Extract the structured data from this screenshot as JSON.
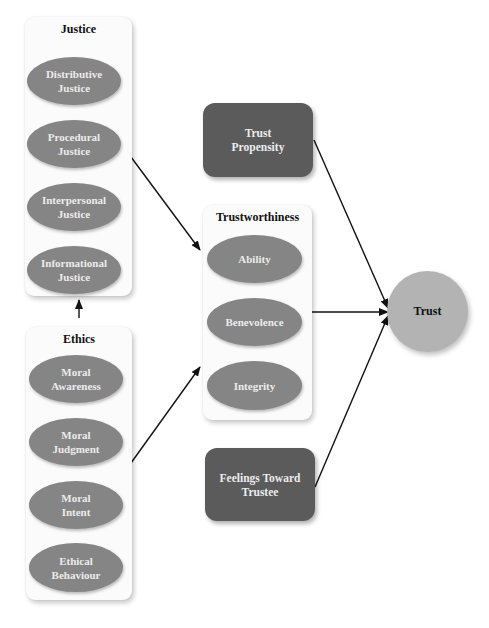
{
  "justice": {
    "title": "Justice",
    "items": [
      {
        "label": "Distributive\nJustice"
      },
      {
        "label": "Procedural\nJustice"
      },
      {
        "label": "Interpersonal\nJustice"
      },
      {
        "label": "Informational\nJustice"
      }
    ]
  },
  "ethics": {
    "title": "Ethics",
    "items": [
      {
        "label": "Moral\nAwareness"
      },
      {
        "label": "Moral\nJudgment"
      },
      {
        "label": "Moral\nIntent"
      },
      {
        "label": "Ethical\nBehaviour"
      }
    ]
  },
  "trustworthiness": {
    "title": "Trustworthiness",
    "items": [
      {
        "label": "Ability"
      },
      {
        "label": "Benevolence"
      },
      {
        "label": "Integrity"
      }
    ]
  },
  "trust_propensity": {
    "label": "Trust\nPropensity"
  },
  "feelings_toward_trustee": {
    "label": "Feelings Toward\nTrustee"
  },
  "trust": {
    "label": "Trust"
  },
  "colors": {
    "ellipse_fill": "#858585",
    "dark_box_fill": "#5b5b5b",
    "trust_circle_fill": "#b3b3b3",
    "panel_fill": "#fbfbfb",
    "arrow": "#111111"
  },
  "edges": [
    {
      "from": "Ethics",
      "to": "Justice"
    },
    {
      "from": "Justice",
      "to": "Trustworthiness"
    },
    {
      "from": "Ethics",
      "to": "Trustworthiness"
    },
    {
      "from": "Trust Propensity",
      "to": "Trust"
    },
    {
      "from": "Trustworthiness",
      "to": "Trust"
    },
    {
      "from": "Feelings Toward Trustee",
      "to": "Trust"
    }
  ]
}
